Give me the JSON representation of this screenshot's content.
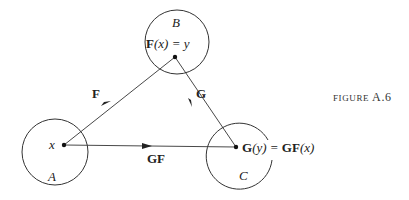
{
  "figure": {
    "caption_prefix": "FIGURE",
    "caption_number": "A.6"
  },
  "sets": [
    {
      "id": "A",
      "label": "A",
      "element": "x"
    },
    {
      "id": "B",
      "label": "B",
      "element_bold": "F",
      "element_rest": "(x) = y"
    },
    {
      "id": "C",
      "label": "C",
      "element_lhs_bold": "G",
      "element_lhs_rest": "(y) = ",
      "element_rhs_bold": "GF",
      "element_rhs_rest": "(x)"
    }
  ],
  "arrows": [
    {
      "from": "A",
      "to": "B",
      "label": "F"
    },
    {
      "from": "B",
      "to": "C",
      "label": "G"
    },
    {
      "from": "A",
      "to": "C",
      "label": "GF"
    }
  ],
  "colors": {
    "stroke": "#333333",
    "background": "#ffffff"
  }
}
